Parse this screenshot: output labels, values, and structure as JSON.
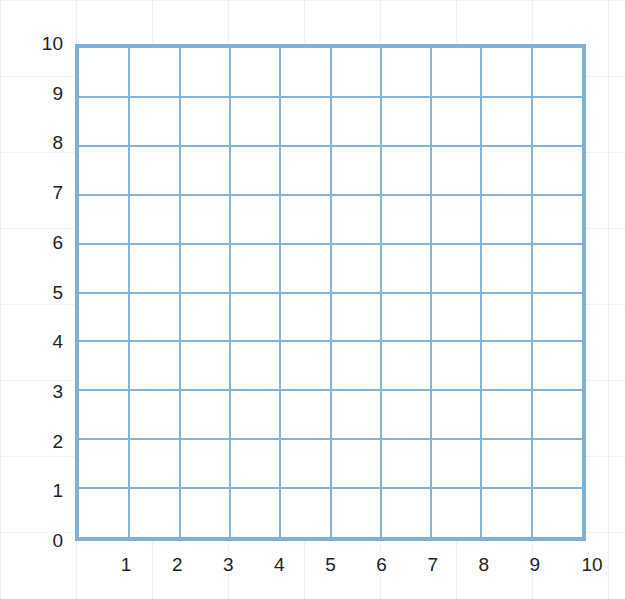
{
  "chart_data": {
    "type": "scatter",
    "title": "",
    "xlabel": "",
    "ylabel": "",
    "x_ticks": [
      "1",
      "2",
      "3",
      "4",
      "5",
      "6",
      "7",
      "8",
      "9",
      "10"
    ],
    "y_ticks": [
      "0",
      "1",
      "2",
      "3",
      "4",
      "5",
      "6",
      "7",
      "8",
      "9",
      "10"
    ],
    "xlim": [
      0,
      10
    ],
    "ylim": [
      0,
      10
    ],
    "grid": true,
    "series": [],
    "legend": null,
    "colors": {
      "grid": "#86b4d6",
      "border": "#7fb0d6",
      "text": "#222222"
    }
  }
}
